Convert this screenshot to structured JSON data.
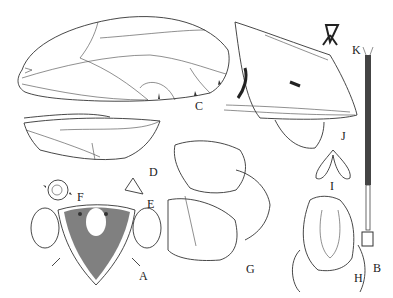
{
  "figure": {
    "type": "morphological line-drawing plate",
    "panels": [
      {
        "id": "A",
        "label": "A",
        "depicts": "head, frontal view",
        "x": 139,
        "y": 270
      },
      {
        "id": "B",
        "label": "B",
        "depicts": "antenna",
        "x": 373,
        "y": 262
      },
      {
        "id": "C",
        "label": "C",
        "depicts": "forewing",
        "x": 195,
        "y": 100
      },
      {
        "id": "D",
        "label": "D",
        "depicts": "hindwing",
        "x": 149,
        "y": 166
      },
      {
        "id": "E",
        "label": "E",
        "depicts": "process",
        "x": 147,
        "y": 198
      },
      {
        "id": "F",
        "label": "F",
        "depicts": "ocellus/spiracle detail",
        "x": 77,
        "y": 191
      },
      {
        "id": "G",
        "label": "G",
        "depicts": "genital capsule, lateral view",
        "x": 246,
        "y": 263
      },
      {
        "id": "H",
        "label": "H",
        "depicts": "genital structure, ventral view",
        "x": 354,
        "y": 272
      },
      {
        "id": "I",
        "label": "I",
        "depicts": "paired appendages",
        "x": 330,
        "y": 180
      },
      {
        "id": "J",
        "label": "J",
        "depicts": "terminalia, lateral view",
        "x": 341,
        "y": 130
      },
      {
        "id": "K",
        "label": "K",
        "depicts": "small sclerite",
        "x": 352,
        "y": 44
      }
    ]
  }
}
